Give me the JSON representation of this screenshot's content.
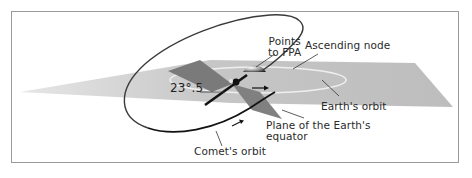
{
  "diagram": {
    "labels": {
      "points_to_fpa_line1": "Points",
      "points_to_fpa_line2": "to FPA",
      "ascending_node": "Ascending node",
      "angle": "23°.5",
      "earths_orbit": "Earth's orbit",
      "plane_equator_line1": "Plane of the Earth's",
      "plane_equator_line2": "equator",
      "comets_orbit": "Comet's orbit"
    },
    "colors": {
      "ecliptic_plane": "#c4c4c4",
      "equator_plane": "#7e7e7e",
      "orbit_line": "#2b2b2b",
      "earth_orbit_ring": "#ececec",
      "frame_border": "#9a9a9a"
    }
  }
}
